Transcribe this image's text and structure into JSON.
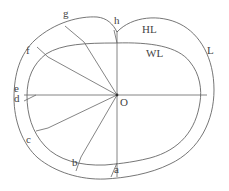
{
  "diagram": {
    "type": "cross-section geometry",
    "center_label": "O",
    "region_labels": {
      "outer_band": "HL",
      "inner_region": "WL",
      "outer_boundary": "L"
    },
    "point_labels": [
      "a",
      "b",
      "c",
      "d",
      "e",
      "f",
      "g",
      "h"
    ],
    "colors": {
      "stroke": "#666666",
      "text": "#444444",
      "background": "#ffffff"
    }
  }
}
